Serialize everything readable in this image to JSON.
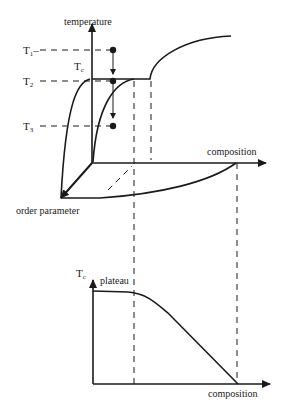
{
  "figure": {
    "top_panel": {
      "y_axis_label": "temperature",
      "x_axis_label": "composition",
      "z_axis_label": "order parameter",
      "temperature_levels": [
        {
          "id": "T1",
          "base": "T",
          "sub": "1"
        },
        {
          "id": "T2",
          "base": "T",
          "sub": "2"
        },
        {
          "id": "T3",
          "base": "T",
          "sub": "3"
        }
      ],
      "tc_label": {
        "base": "T",
        "sub": "c"
      }
    },
    "bottom_panel": {
      "y_axis_label": {
        "base": "T",
        "sub": "c"
      },
      "plateau_label": "plateau",
      "x_axis_label": "composition"
    }
  },
  "colors": {
    "ink": "#1a1a1a",
    "background": "#ffffff"
  }
}
